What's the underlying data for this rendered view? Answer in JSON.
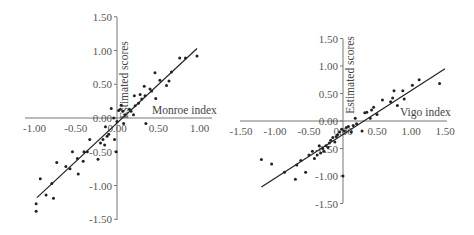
{
  "chart_data": [
    {
      "type": "scatter",
      "title": "",
      "xlabel": "Monroe index",
      "ylabel": "Estimated scores",
      "xlim": [
        -1.0,
        1.0
      ],
      "ylim": [
        -1.5,
        1.5
      ],
      "x_ticks": [
        "-1.00",
        "-0.50",
        "0.00",
        "0.50",
        "1.00"
      ],
      "y_ticks": [
        "1.50",
        "1.00",
        "0.50",
        "0.00",
        "-0.50",
        "-1.00",
        "-1.50"
      ],
      "grid": false,
      "legend": null,
      "regression_line": {
        "x": [
          -0.97,
          0.97
        ],
        "y": [
          -1.18,
          1.03
        ]
      },
      "points": [
        [
          -0.98,
          -1.38
        ],
        [
          -0.98,
          -1.27
        ],
        [
          -0.93,
          -0.9
        ],
        [
          -0.86,
          -1.14
        ],
        [
          -0.79,
          -0.97
        ],
        [
          -0.77,
          -1.19
        ],
        [
          -0.73,
          -0.66
        ],
        [
          -0.62,
          -0.72
        ],
        [
          -0.57,
          -0.75
        ],
        [
          -0.54,
          -0.5
        ],
        [
          -0.48,
          -0.6
        ],
        [
          -0.47,
          -0.83
        ],
        [
          -0.41,
          -0.64
        ],
        [
          -0.4,
          -0.5
        ],
        [
          -0.36,
          -0.5
        ],
        [
          -0.33,
          -0.32
        ],
        [
          -0.23,
          -0.61
        ],
        [
          -0.2,
          -0.37
        ],
        [
          -0.17,
          -0.32
        ],
        [
          -0.15,
          -0.4
        ],
        [
          -0.14,
          -0.13
        ],
        [
          -0.12,
          -0.27
        ],
        [
          -0.1,
          -0.24
        ],
        [
          -0.07,
          0.14
        ],
        [
          -0.04,
          0.0
        ],
        [
          -0.03,
          -0.32
        ],
        [
          -0.01,
          -0.5
        ],
        [
          0.0,
          -0.05
        ],
        [
          0.02,
          0.11
        ],
        [
          0.04,
          0.13
        ],
        [
          0.05,
          0.19
        ],
        [
          0.07,
          0.1
        ],
        [
          0.08,
          -0.08
        ],
        [
          0.1,
          0.05
        ],
        [
          0.15,
          0.13
        ],
        [
          0.17,
          0.1
        ],
        [
          0.2,
          0.05
        ],
        [
          0.21,
          0.33
        ],
        [
          0.22,
          0.18
        ],
        [
          0.26,
          0.22
        ],
        [
          0.28,
          0.35
        ],
        [
          0.3,
          0.28
        ],
        [
          0.33,
          0.47
        ],
        [
          0.34,
          0.33
        ],
        [
          0.35,
          -0.08
        ],
        [
          0.4,
          0.43
        ],
        [
          0.42,
          0.4
        ],
        [
          0.46,
          0.67
        ],
        [
          0.47,
          0.29
        ],
        [
          0.52,
          0.56
        ],
        [
          0.6,
          0.48
        ],
        [
          0.63,
          0.55
        ],
        [
          0.66,
          0.68
        ],
        [
          0.76,
          0.89
        ],
        [
          0.83,
          0.89
        ],
        [
          0.97,
          0.92
        ]
      ]
    },
    {
      "type": "scatter",
      "title": "",
      "xlabel": "Vigo index",
      "ylabel": "Estimated scores",
      "xlim": [
        -1.5,
        1.5
      ],
      "ylim": [
        -1.5,
        1.5
      ],
      "x_ticks": [
        "-1.50",
        "-1.00",
        "-0.50",
        "0.00",
        "0.50",
        "1.00",
        "1.50"
      ],
      "y_ticks": [
        "1.50",
        "1.00",
        "0.50",
        "0.00",
        "-0.50",
        "-1.00",
        "-1.50"
      ],
      "grid": false,
      "legend": null,
      "regression_line": {
        "x": [
          -1.2,
          1.5
        ],
        "y": [
          -1.2,
          0.95
        ]
      },
      "points": [
        [
          -1.2,
          -0.7
        ],
        [
          -1.05,
          -0.78
        ],
        [
          -0.86,
          -0.93
        ],
        [
          -0.7,
          -1.06
        ],
        [
          -0.68,
          -0.8
        ],
        [
          -0.55,
          -0.93
        ],
        [
          -0.62,
          -0.72
        ],
        [
          -0.5,
          -0.62
        ],
        [
          -0.45,
          -0.55
        ],
        [
          -0.42,
          -0.68
        ],
        [
          -0.38,
          -0.62
        ],
        [
          -0.35,
          -0.45
        ],
        [
          -0.33,
          -0.58
        ],
        [
          -0.3,
          -0.5
        ],
        [
          -0.28,
          -0.55
        ],
        [
          -0.25,
          -0.45
        ],
        [
          -0.22,
          -0.48
        ],
        [
          -0.2,
          -0.4
        ],
        [
          -0.18,
          -0.35
        ],
        [
          -0.15,
          -0.3
        ],
        [
          -0.12,
          -0.38
        ],
        [
          -0.1,
          -0.28
        ],
        [
          -0.08,
          -0.25
        ],
        [
          -0.05,
          -0.2
        ],
        [
          -0.02,
          -0.15
        ],
        [
          0.0,
          -1.0
        ],
        [
          0.02,
          -0.18
        ],
        [
          0.05,
          -0.12
        ],
        [
          0.08,
          -0.1
        ],
        [
          0.12,
          -0.2
        ],
        [
          0.15,
          -0.08
        ],
        [
          0.18,
          0.05
        ],
        [
          0.2,
          -0.05
        ],
        [
          0.28,
          -0.18
        ],
        [
          0.32,
          0.15
        ],
        [
          0.35,
          0.16
        ],
        [
          0.4,
          0.05
        ],
        [
          0.42,
          0.2
        ],
        [
          0.45,
          0.25
        ],
        [
          0.5,
          0.12
        ],
        [
          0.58,
          0.38
        ],
        [
          0.7,
          0.35
        ],
        [
          0.73,
          0.42
        ],
        [
          0.75,
          0.55
        ],
        [
          0.8,
          0.28
        ],
        [
          0.88,
          0.55
        ],
        [
          0.9,
          0.4
        ],
        [
          1.02,
          0.65
        ],
        [
          1.12,
          0.75
        ],
        [
          1.42,
          0.68
        ]
      ]
    }
  ]
}
